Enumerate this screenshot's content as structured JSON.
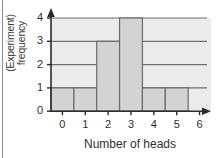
{
  "chart_data": {
    "type": "bar",
    "title": "",
    "subtitle": "",
    "xlabel": "Number of heads",
    "ylabel": "(Experiment) frequency",
    "ylabel_lines": [
      "(Experiment)",
      "frequency"
    ],
    "categories": [
      "0",
      "1",
      "2",
      "3",
      "4",
      "5",
      "6"
    ],
    "values": [
      1,
      1,
      3,
      4,
      1,
      1,
      0
    ],
    "x_ticks": [
      "0",
      "1",
      "2",
      "3",
      "4",
      "5",
      "6"
    ],
    "y_ticks": [
      "0",
      "1",
      "2",
      "3",
      "4"
    ],
    "xlim": [
      -0.5,
      6.5
    ],
    "ylim": [
      0,
      4
    ],
    "grid": "horizontal",
    "legend": null,
    "legend_position": "none",
    "annotations": [],
    "colors": {
      "plot_background": "#ebebeb",
      "bar_fill": "#d3d3d3",
      "bar_stroke": "#6b6b6b",
      "gridline": "#6f6f6f",
      "axis": "#2b2b2b",
      "tick_text": "#2e2e2e",
      "label_text": "#3a3a3a",
      "page_border": "#8d8d8d",
      "page_background": "#ffffff"
    }
  }
}
